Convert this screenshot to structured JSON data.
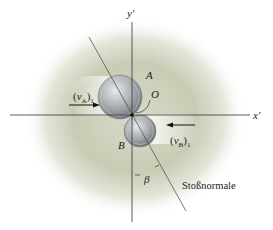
{
  "diagram": {
    "title": "",
    "axes": {
      "x_label": "x'",
      "y_label": "y'"
    },
    "origin_label": "O",
    "bodies": [
      {
        "id": "A",
        "label": "A",
        "velocity_label": "v",
        "velocity_sub_body": "A",
        "velocity_sub_index": "1",
        "direction": "right"
      },
      {
        "id": "B",
        "label": "B",
        "velocity_label": "v",
        "velocity_sub_body": "B",
        "velocity_sub_index": "1",
        "direction": "left"
      }
    ],
    "angle_label": "β",
    "normal_label": "Stoßnormale",
    "colors": {
      "background_glow": "#c9ccb4",
      "line": "#333333",
      "coin": "#9a9ea2"
    }
  }
}
